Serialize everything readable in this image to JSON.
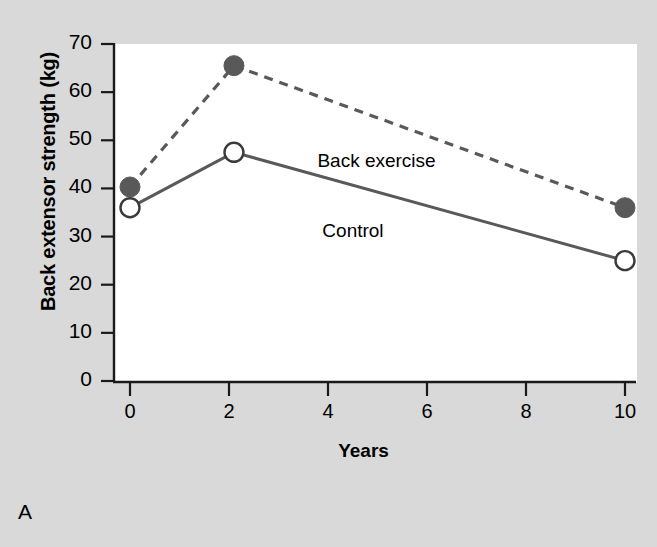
{
  "panel": {
    "letter": "A"
  },
  "chart_data": {
    "type": "line",
    "title": "",
    "xlabel": "Years",
    "ylabel": "Back extensor strength (kg)",
    "xlim": [
      0,
      10
    ],
    "ylim": [
      0,
      70
    ],
    "xticks": [
      0,
      2,
      4,
      6,
      8,
      10
    ],
    "xtick_labels": [
      "0",
      "2",
      "4",
      "6",
      "8",
      "10"
    ],
    "yticks": [
      0,
      10,
      20,
      30,
      40,
      50,
      60,
      70
    ],
    "ytick_labels": [
      "0",
      "10",
      "20",
      "30",
      "40",
      "50",
      "60",
      "70"
    ],
    "grid": false,
    "legend_position": "inline-annotations",
    "series": [
      {
        "name": "Back exercise",
        "x": [
          0,
          2.1,
          10
        ],
        "values": [
          40.3,
          65.5,
          36
        ],
        "line_style": "dashed",
        "marker": "filled-circle",
        "color": "#595959"
      },
      {
        "name": "Control",
        "x": [
          0,
          2.1,
          10
        ],
        "values": [
          36,
          47.5,
          25
        ],
        "line_style": "solid",
        "marker": "open-circle",
        "color": "#595959"
      }
    ],
    "annotations": [
      {
        "text": "Back exercise",
        "x": 5.2,
        "y": 45.5
      },
      {
        "text": "Control",
        "x": 5.3,
        "y": 31.0
      }
    ]
  },
  "colors": {
    "background": "#d9d9d9",
    "plot_background": "#ffffff",
    "axis": "#1a1a1a",
    "series_gray": "#595959"
  }
}
